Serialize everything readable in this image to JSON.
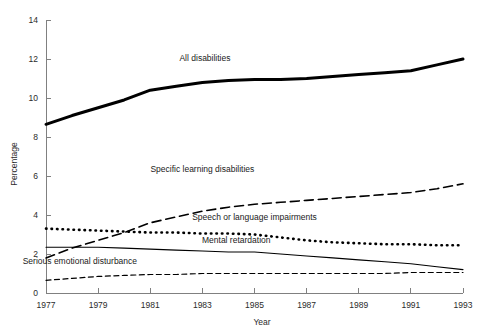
{
  "chart_data": {
    "type": "line",
    "title": "",
    "xlabel": "Year",
    "ylabel": "Percentage",
    "xlim": [
      1977,
      1993
    ],
    "ylim": [
      0,
      14
    ],
    "ytick_step": 2,
    "grid": false,
    "legend": "inline-annotations",
    "x": [
      1977,
      1978,
      1979,
      1980,
      1981,
      1982,
      1983,
      1984,
      1985,
      1986,
      1987,
      1988,
      1989,
      1990,
      1991,
      1992,
      1993
    ],
    "xticklabels": [
      "1977",
      "1979",
      "1981",
      "1983",
      "1985",
      "1987",
      "1989",
      "1991",
      "1993"
    ],
    "yticklabels": [
      "0",
      "2",
      "4",
      "6",
      "8",
      "10",
      "12",
      "14"
    ],
    "series": [
      {
        "name": "All disabilities",
        "label": "All disabilities",
        "style": "solid-thick",
        "color": "#000000",
        "width": 3.0,
        "values": [
          8.65,
          9.1,
          9.5,
          9.9,
          10.4,
          10.6,
          10.8,
          10.9,
          10.95,
          10.95,
          11.0,
          11.1,
          11.2,
          11.3,
          11.4,
          11.7,
          12.0
        ],
        "label_x": 1983.1,
        "label_y": 11.9
      },
      {
        "name": "Specific learning disabilities",
        "label": "Specific learning disabilities",
        "style": "dashed",
        "color": "#000000",
        "width": 1.6,
        "values": [
          1.8,
          2.3,
          2.7,
          3.1,
          3.6,
          3.9,
          4.2,
          4.4,
          4.55,
          4.65,
          4.75,
          4.85,
          4.95,
          5.05,
          5.15,
          5.35,
          5.6
        ],
        "label_x": 1983.0,
        "label_y": 6.2
      },
      {
        "name": "Speech or language impairments",
        "label": "Speech or language impairments",
        "style": "dotted",
        "color": "#000000",
        "width": 2.6,
        "values": [
          3.3,
          3.25,
          3.2,
          3.15,
          3.1,
          3.1,
          3.05,
          3.05,
          3.0,
          2.85,
          2.7,
          2.6,
          2.55,
          2.5,
          2.5,
          2.45,
          2.45
        ],
        "label_x": 1985.0,
        "label_y": 3.75
      },
      {
        "name": "Mental retardation",
        "label": "Mental retardation",
        "style": "solid-thin",
        "color": "#000000",
        "width": 1.1,
        "values": [
          2.35,
          2.35,
          2.35,
          2.3,
          2.25,
          2.2,
          2.15,
          2.1,
          2.1,
          2.0,
          1.9,
          1.8,
          1.7,
          1.6,
          1.5,
          1.35,
          1.2
        ],
        "label_x": 1984.3,
        "label_y": 2.55
      },
      {
        "name": "Serious emotional disturbance",
        "label": "Serious emotional disturbance",
        "style": "dashed-fine",
        "color": "#000000",
        "width": 1.2,
        "values": [
          0.65,
          0.75,
          0.85,
          0.9,
          0.95,
          0.95,
          1.0,
          1.0,
          1.0,
          1.0,
          1.0,
          1.0,
          1.0,
          1.0,
          1.05,
          1.05,
          1.05
        ],
        "label_x": 1978.3,
        "label_y": 1.5
      }
    ]
  }
}
